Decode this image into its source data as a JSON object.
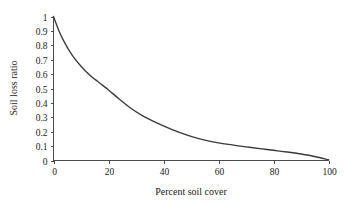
{
  "chart_data": {
    "type": "line",
    "title": "",
    "xlabel": "Percent soil cover",
    "ylabel": "Soil loss ratio",
    "xlim": [
      0,
      100
    ],
    "ylim": [
      0,
      1
    ],
    "grid": false,
    "legend": false,
    "line_color": "#3a3a3a",
    "background_color": "#ffffff",
    "axis_color": "#4a4a4a",
    "xticks": [
      0,
      20,
      40,
      60,
      80,
      100
    ],
    "xtick_labels": [
      "0",
      "20",
      "40",
      "60",
      "80",
      "100"
    ],
    "yticks": [
      0,
      0.1,
      0.2,
      0.3,
      0.4,
      0.5,
      0.6,
      0.7,
      0.8,
      0.9,
      1
    ],
    "ytick_labels": [
      "0",
      "0.1",
      "0.2",
      "0.3",
      "0.4",
      "0.5",
      "0.6",
      "0.7",
      "0.8",
      "0.9",
      "1"
    ],
    "series": [
      {
        "name": "Soil loss ratio",
        "x": [
          0,
          2,
          4,
          6,
          8,
          10,
          12,
          14,
          16,
          18,
          20,
          24,
          28,
          32,
          36,
          40,
          45,
          50,
          55,
          60,
          65,
          70,
          75,
          80,
          85,
          90,
          95,
          100
        ],
        "values": [
          1.0,
          0.9,
          0.82,
          0.755,
          0.7,
          0.655,
          0.615,
          0.58,
          0.55,
          0.52,
          0.49,
          0.425,
          0.365,
          0.315,
          0.275,
          0.24,
          0.2,
          0.168,
          0.142,
          0.122,
          0.108,
          0.095,
          0.083,
          0.071,
          0.059,
          0.045,
          0.028,
          0.005
        ]
      }
    ]
  },
  "axes": {
    "y_title": "Soil loss ratio",
    "x_title": "Percent soil cover"
  }
}
